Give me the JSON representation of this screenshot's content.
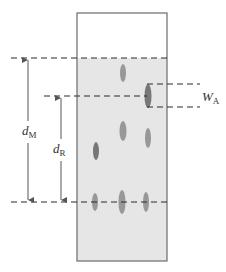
{
  "diagram": {
    "type": "thin-layer chromatography plate",
    "colors": {
      "plate_border": "#6b6b6b",
      "plate_fill_developed": "#e6e6e6",
      "plate_fill_undeveloped": "#ffffff",
      "dashed_line": "#2a2a2a",
      "arrow": "#555555",
      "spot": "#8f8f8f",
      "spot_dark": "#6a6a6a",
      "text": "#333333"
    },
    "plate": {
      "x": 77,
      "y": 13,
      "width": 90,
      "height": 248,
      "solvent_front_y": 58
    },
    "lines": {
      "solvent_front": {
        "y": 58,
        "x1": 11,
        "x2": 167
      },
      "analyte_center": {
        "y": 96,
        "x1": 44,
        "x2": 147
      },
      "baseline": {
        "y": 202,
        "x1": 11,
        "x2": 167
      },
      "width_top": {
        "y": 84,
        "x1": 147,
        "x2": 200
      },
      "width_bottom": {
        "y": 107,
        "x1": 147,
        "x2": 200
      }
    },
    "arrows": {
      "dM": {
        "x": 28,
        "y_top": 58,
        "y_bottom": 202
      },
      "dR": {
        "x": 61,
        "y_top": 96,
        "y_bottom": 202
      }
    },
    "labels": {
      "dM": {
        "main": "d",
        "sub": "M",
        "x": 22,
        "y": 135
      },
      "dR": {
        "main": "d",
        "sub": "R",
        "x": 53,
        "y": 153
      },
      "WA": {
        "main": "W",
        "sub": "A",
        "x": 202,
        "y": 101
      }
    },
    "spots": [
      {
        "cx": 123,
        "cy": 73,
        "rx": 3.0,
        "ry": 9,
        "shade": "spot"
      },
      {
        "cx": 148,
        "cy": 96,
        "rx": 3.5,
        "ry": 12,
        "shade": "spot_dark"
      },
      {
        "cx": 123,
        "cy": 131,
        "rx": 3.5,
        "ry": 10,
        "shade": "spot"
      },
      {
        "cx": 148,
        "cy": 138,
        "rx": 3.0,
        "ry": 10,
        "shade": "spot"
      },
      {
        "cx": 96,
        "cy": 151,
        "rx": 3.0,
        "ry": 9,
        "shade": "spot_dark"
      },
      {
        "cx": 95,
        "cy": 202,
        "rx": 3.0,
        "ry": 9,
        "shade": "spot"
      },
      {
        "cx": 122,
        "cy": 202,
        "rx": 3.5,
        "ry": 12,
        "shade": "spot"
      },
      {
        "cx": 146,
        "cy": 202,
        "rx": 3.0,
        "ry": 10,
        "shade": "spot"
      }
    ]
  }
}
